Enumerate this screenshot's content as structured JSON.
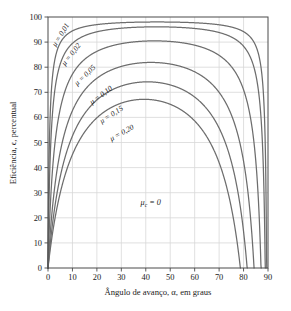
{
  "chart_data": {
    "type": "line",
    "title": "",
    "xlabel": "Ângulo de avanço, α, em graus",
    "ylabel": "Eficiência, ϵ, percentual",
    "xlim": [
      0,
      90
    ],
    "ylim": [
      0,
      100
    ],
    "xticks": [
      0,
      10,
      20,
      30,
      40,
      50,
      60,
      70,
      80,
      90
    ],
    "yticks": [
      0,
      10,
      20,
      30,
      40,
      50,
      60,
      70,
      80,
      90,
      100
    ],
    "xtick_labels": [
      "0",
      "10",
      "20",
      "30",
      "40",
      "50",
      "60",
      "70",
      "80",
      "90"
    ],
    "ytick_labels": [
      "0",
      "10",
      "20",
      "30",
      "40",
      "50",
      "60",
      "70",
      "80",
      "90",
      "100"
    ],
    "grid": true,
    "legend_position": "inline-curve-labels",
    "curve_color": "#6d6d6d",
    "grid_color": "#d8d8d8",
    "frame_color": "#4a4a4a",
    "formula": "eff = 100 * tan(a) * (1 - mu*tan(a)) / (tan(a) + mu)",
    "series": [
      {
        "name": "mu = 0,01",
        "label": "μ = 0,01",
        "mu": 0.01,
        "peak_x": 44,
        "peak_y": 98.5,
        "zero_x": 89.4,
        "label_x": 3.2,
        "label_y": 88.0,
        "label_rotation": -58
      },
      {
        "name": "mu = 0,02",
        "label": "μ = 0,02",
        "mu": 0.02,
        "peak_x": 43,
        "peak_y": 96.5,
        "zero_x": 88.5,
        "label_x": 7.0,
        "label_y": 80.5,
        "label_rotation": -52
      },
      {
        "name": "mu = 0,05",
        "label": "μ = 0,05",
        "mu": 0.05,
        "peak_x": 42,
        "peak_y": 91.0,
        "zero_x": 87.0,
        "label_x": 12.0,
        "label_y": 72.5,
        "label_rotation": -44
      },
      {
        "name": "mu = 0,10",
        "label": "μ = 0,10",
        "mu": 0.1,
        "peak_x": 41,
        "peak_y": 81.5,
        "zero_x": 84.0,
        "label_x": 18.0,
        "label_y": 65.0,
        "label_rotation": -37
      },
      {
        "name": "mu = 0,15",
        "label": "μ = 0,15",
        "mu": 0.15,
        "peak_x": 40,
        "peak_y": 73.5,
        "zero_x": 81.0,
        "label_x": 22.0,
        "label_y": 57.5,
        "label_rotation": -33
      },
      {
        "name": "mu = 0,20",
        "label": "μ = 0,20",
        "mu": 0.2,
        "peak_x": 40,
        "peak_y": 66.5,
        "zero_x": 78.5,
        "label_x": 26.0,
        "label_y": 50.5,
        "label_rotation": -29
      }
    ],
    "annotations": [
      {
        "name": "mu-c-zero",
        "text_main": "μ",
        "text_sub": "c",
        "text_rest": " = 0",
        "full_text": "μᶜ = 0",
        "x": 42,
        "y": 25
      }
    ]
  }
}
